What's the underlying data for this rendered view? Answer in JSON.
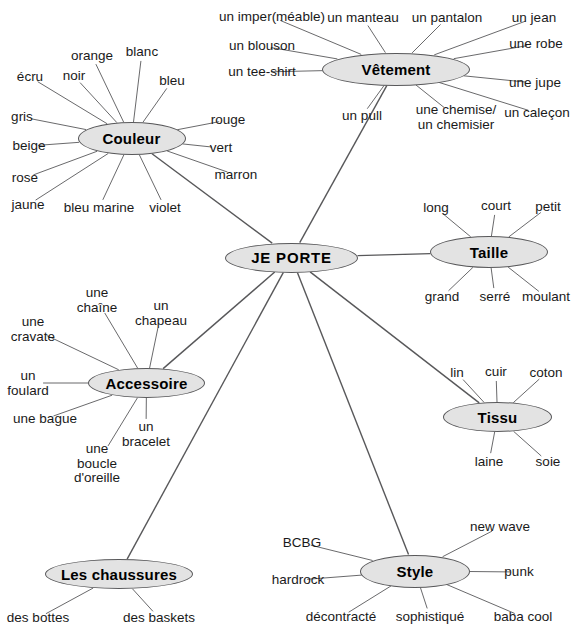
{
  "diagram": {
    "title": "JE PORTE",
    "type": "mind-map",
    "language": "French",
    "colors": {
      "node_fill": "#e3e3e3",
      "node_stroke": "#58585a",
      "edge": "#58585a",
      "text": "#1a1a1a",
      "background": "#ffffff"
    }
  },
  "center": {
    "label": "JE PORTE",
    "x": 291.5,
    "y": 257.5,
    "rx": 66.5,
    "ry": 15,
    "font_size": 15
  },
  "branches": [
    {
      "id": "couleur",
      "label": "Couleur",
      "x": 131.5,
      "y": 138.5,
      "rx": 54,
      "ry": 16.5,
      "font_size": 15,
      "leaves": [
        {
          "label": "orange",
          "x": 92,
          "y": 56,
          "align": "c"
        },
        {
          "label": "blanc",
          "x": 142,
          "y": 52,
          "align": "c"
        },
        {
          "label": "bleu",
          "x": 172,
          "y": 81,
          "align": "c"
        },
        {
          "label": "écru",
          "x": 30,
          "y": 77,
          "align": "c"
        },
        {
          "label": "noir",
          "x": 74,
          "y": 76,
          "align": "c"
        },
        {
          "label": "gris",
          "x": 22,
          "y": 117,
          "align": "c"
        },
        {
          "label": "beige",
          "x": 29,
          "y": 146,
          "align": "c"
        },
        {
          "label": "rose",
          "x": 25,
          "y": 178,
          "align": "c"
        },
        {
          "label": "jaune",
          "x": 28,
          "y": 205,
          "align": "c"
        },
        {
          "label": "bleu marine",
          "x": 99,
          "y": 208,
          "align": "c"
        },
        {
          "label": "violet",
          "x": 165,
          "y": 208,
          "align": "c"
        },
        {
          "label": "rouge",
          "x": 228,
          "y": 120,
          "align": "c"
        },
        {
          "label": "vert",
          "x": 221,
          "y": 148,
          "align": "c"
        },
        {
          "label": "marron",
          "x": 236,
          "y": 175,
          "align": "c"
        }
      ]
    },
    {
      "id": "vetement",
      "label": "Vêtement",
      "x": 396,
      "y": 69,
      "rx": 74,
      "ry": 16.5,
      "font_size": 15,
      "leaves": [
        {
          "label": "un imper(méable)",
          "x": 272,
          "y": 17,
          "align": "c"
        },
        {
          "label": "un manteau",
          "x": 363,
          "y": 18,
          "align": "c"
        },
        {
          "label": "un pantalon",
          "x": 447,
          "y": 18,
          "align": "c"
        },
        {
          "label": "un jean",
          "x": 534,
          "y": 18,
          "align": "c"
        },
        {
          "label": "un blouson",
          "x": 262,
          "y": 46,
          "align": "c"
        },
        {
          "label": "une robe",
          "x": 536,
          "y": 44,
          "align": "c"
        },
        {
          "label": "un tee-shirt",
          "x": 262,
          "y": 72,
          "align": "c"
        },
        {
          "label": "une jupe",
          "x": 535,
          "y": 83,
          "align": "c"
        },
        {
          "label": "un pull",
          "x": 362,
          "y": 116,
          "align": "c"
        },
        {
          "label": "une chemise/\nun chemisier",
          "x": 456,
          "y": 117,
          "align": "c"
        },
        {
          "label": "un caleçon",
          "x": 537,
          "y": 113,
          "align": "c"
        }
      ]
    },
    {
      "id": "taille",
      "label": "Taille",
      "x": 489,
      "y": 252,
      "rx": 59,
      "ry": 16,
      "font_size": 15,
      "leaves": [
        {
          "label": "long",
          "x": 436,
          "y": 208,
          "align": "c"
        },
        {
          "label": "court",
          "x": 496,
          "y": 206,
          "align": "c"
        },
        {
          "label": "petit",
          "x": 548,
          "y": 207,
          "align": "c"
        },
        {
          "label": "grand",
          "x": 442,
          "y": 297,
          "align": "c"
        },
        {
          "label": "serré",
          "x": 495,
          "y": 297,
          "align": "c"
        },
        {
          "label": "moulant",
          "x": 546,
          "y": 297,
          "align": "c"
        }
      ]
    },
    {
      "id": "tissu",
      "label": "Tissu",
      "x": 497.5,
      "y": 417,
      "rx": 54.5,
      "ry": 15,
      "font_size": 15,
      "leaves": [
        {
          "label": "lin",
          "x": 457,
          "y": 373,
          "align": "c"
        },
        {
          "label": "cuir",
          "x": 496,
          "y": 372,
          "align": "c"
        },
        {
          "label": "coton",
          "x": 546,
          "y": 373,
          "align": "c"
        },
        {
          "label": "laine",
          "x": 489,
          "y": 462,
          "align": "c"
        },
        {
          "label": "soie",
          "x": 548,
          "y": 462,
          "align": "c"
        }
      ]
    },
    {
      "id": "accessoire",
      "label": "Accessoire",
      "x": 146.5,
      "y": 383,
      "rx": 58.5,
      "ry": 15,
      "font_size": 15,
      "leaves": [
        {
          "label": "une\nchaîne",
          "x": 97,
          "y": 300,
          "align": "c"
        },
        {
          "label": "un\nchapeau",
          "x": 161,
          "y": 313,
          "align": "c"
        },
        {
          "label": "une\ncravate",
          "x": 33,
          "y": 329,
          "align": "c"
        },
        {
          "label": "un\nfoulard",
          "x": 28,
          "y": 383,
          "align": "c"
        },
        {
          "label": "une bague",
          "x": 45,
          "y": 419,
          "align": "c"
        },
        {
          "label": "une\nboucle\nd'oreille",
          "x": 97,
          "y": 464,
          "align": "c"
        },
        {
          "label": "un\nbracelet",
          "x": 146,
          "y": 434,
          "align": "c"
        }
      ]
    },
    {
      "id": "chaussures",
      "label": "Les chaussures",
      "x": 119,
      "y": 574,
      "rx": 74,
      "ry": 15,
      "font_size": 15,
      "leaves": [
        {
          "label": "des bottes",
          "x": 38,
          "y": 618,
          "align": "c"
        },
        {
          "label": "des baskets",
          "x": 159,
          "y": 618,
          "align": "c"
        }
      ]
    },
    {
      "id": "style",
      "label": "Style",
      "x": 415,
      "y": 571,
      "rx": 55,
      "ry": 16.5,
      "font_size": 15,
      "leaves": [
        {
          "label": "BCBG",
          "x": 302,
          "y": 543,
          "align": "c"
        },
        {
          "label": "new wave",
          "x": 500,
          "y": 527,
          "align": "c"
        },
        {
          "label": "hardrock",
          "x": 298,
          "y": 580,
          "align": "c"
        },
        {
          "label": "punk",
          "x": 519,
          "y": 572,
          "align": "c"
        },
        {
          "label": "décontracté",
          "x": 341,
          "y": 617,
          "align": "c"
        },
        {
          "label": "sophistiqué",
          "x": 430,
          "y": 617,
          "align": "c"
        },
        {
          "label": "baba cool",
          "x": 523,
          "y": 617,
          "align": "c"
        }
      ]
    }
  ]
}
